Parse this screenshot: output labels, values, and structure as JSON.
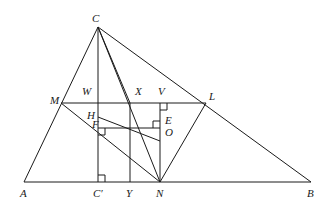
{
  "diagram": {
    "type": "geometry",
    "points": {
      "C": {
        "label": "C",
        "x": 98,
        "y": 27
      },
      "A": {
        "label": "A",
        "x": 24,
        "y": 182
      },
      "B": {
        "label": "B",
        "x": 311,
        "y": 182
      },
      "M": {
        "label": "M",
        "x": 61,
        "y": 103
      },
      "L": {
        "label": "L",
        "x": 206,
        "y": 103
      },
      "N": {
        "label": "N",
        "x": 160,
        "y": 182
      },
      "Cp": {
        "label": "C′",
        "x": 98,
        "y": 182
      },
      "Y": {
        "label": "Y",
        "x": 130,
        "y": 182
      },
      "W": {
        "label": "W",
        "x": 98,
        "y": 103
      },
      "X": {
        "label": "X",
        "x": 130,
        "y": 103
      },
      "V": {
        "label": "V",
        "x": 160,
        "y": 103
      },
      "H": {
        "label": "H",
        "x": 98,
        "y": 117
      },
      "F": {
        "label": "F",
        "x": 98,
        "y": 128
      },
      "E": {
        "label": "E",
        "x": 160,
        "y": 128
      },
      "O": {
        "label": "O",
        "x": 160,
        "y": 141
      }
    },
    "segments": [
      [
        "A",
        "B"
      ],
      [
        "A",
        "C"
      ],
      [
        "C",
        "B"
      ],
      [
        "M",
        "L"
      ],
      [
        "M",
        "N"
      ],
      [
        "L",
        "N"
      ],
      [
        "C",
        "Cp"
      ],
      [
        "C",
        "N"
      ],
      [
        "X",
        "Y"
      ],
      [
        "C",
        "Y"
      ],
      [
        "V",
        "N"
      ],
      [
        "F",
        "E"
      ],
      [
        "H",
        "O"
      ]
    ],
    "right_angles": [
      "Cp",
      "F",
      "E",
      "V"
    ]
  }
}
